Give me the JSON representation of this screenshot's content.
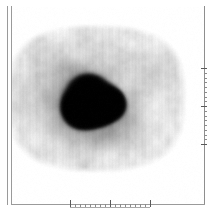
{
  "viewer": {
    "title": "Tomographic Slice Viewer",
    "modality_label": "Transaxial emission tomography slice",
    "colormap": "grayscale-inverted",
    "background_color": "#ffffff"
  },
  "frame": {
    "border_color": "#9a9a9a",
    "left_outer_x": 7,
    "left_inner_x": 11,
    "right_x": 204,
    "bottom_y": 204
  },
  "scan": {
    "name": "slice-image",
    "description": "Grayscale transaxial tomographic slice showing a broad elliptical low-uptake body region with an intense dark bilobed focal uptake region near the center.",
    "body_center_x": 96,
    "body_center_y": 98,
    "body_radius_x": 92,
    "body_radius_y": 76,
    "lesion_center_x": 96,
    "lesion_center_y": 103,
    "lesion_peak_intensity": 1.0,
    "body_base_intensity": 0.12,
    "noise_amplitude": 0.07,
    "streak_amplitude": 0.035
  },
  "chart_data": {
    "type": "heatmap",
    "title": "",
    "xlabel": "",
    "ylabel": "",
    "colormap": "gray_r",
    "grid": false,
    "legend": "none",
    "xlim": [
      0,
      192
    ],
    "ylim": [
      0,
      196
    ],
    "bottom_axis": {
      "x_start_px": 70,
      "x_end_px": 150,
      "tick_count": 17,
      "major_tick_indices": [
        0,
        8,
        16
      ],
      "minor_tick_length_px": 3,
      "major_tick_length_px": 7,
      "tick_labels": []
    },
    "right_axis": {
      "y_start_px": 68,
      "y_end_px": 144,
      "tick_count": 17,
      "major_tick_indices": [
        0,
        8,
        16
      ],
      "minor_tick_length_px": 3,
      "major_tick_length_px": 6,
      "tick_labels": []
    },
    "hotspot": {
      "label": "focal uptake",
      "center": [
        96,
        103
      ],
      "approx_width_px": 72,
      "approx_height_px": 58,
      "relative_intensity": 1.0
    },
    "background_region": {
      "label": "body cross-section",
      "shape": "ellipse",
      "center": [
        96,
        98
      ],
      "semi_axes": [
        92,
        76
      ],
      "relative_intensity": 0.14
    }
  }
}
